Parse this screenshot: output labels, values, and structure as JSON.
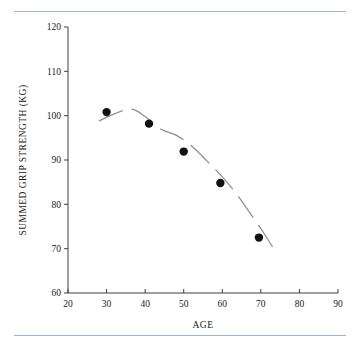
{
  "figure": {
    "has_top_rule": true,
    "has_bottom_rule": true,
    "rule_color": "#9cb4cc",
    "background": "#ffffff"
  },
  "chart_data": {
    "type": "scatter",
    "title": "",
    "xlabel": "AGE",
    "ylabel": "SUMMED GRIP STRENGTH (KG)",
    "xlim": [
      20,
      90
    ],
    "ylim": [
      60,
      120
    ],
    "xticks": [
      20,
      30,
      40,
      50,
      60,
      70,
      80,
      90
    ],
    "yticks": [
      60,
      70,
      80,
      90,
      100,
      110,
      120
    ],
    "xtick_labels": [
      "20",
      "30",
      "40",
      "50",
      "60",
      "70",
      "80",
      "90"
    ],
    "ytick_labels": [
      "60",
      "70",
      "80",
      "90",
      "100",
      "110",
      "120"
    ],
    "grid": false,
    "legend": false,
    "marker_color": "#111111",
    "marker_shape": "circle",
    "marker_size": 4.2,
    "series": [
      {
        "name": "Summed grip strength",
        "x": [
          30,
          41,
          50,
          59.5,
          69.5
        ],
        "y": [
          100.8,
          98.2,
          91.9,
          84.8,
          72.5
        ]
      }
    ],
    "trend_line": {
      "name": "smoothed trend",
      "style": "dashed",
      "color": "#8e8e8e",
      "x": [
        28,
        32,
        36.5,
        40,
        44,
        48,
        52,
        56,
        60,
        64,
        68,
        71,
        74
      ],
      "y": [
        98.8,
        100.4,
        101.5,
        99.8,
        97.0,
        95.6,
        93.2,
        89.8,
        86.2,
        82.0,
        77.0,
        73.2,
        69.0
      ]
    }
  },
  "axis_labels": {
    "x_title": "AGE",
    "y_title": "SUMMED GRIP STRENGTH (KG)"
  }
}
